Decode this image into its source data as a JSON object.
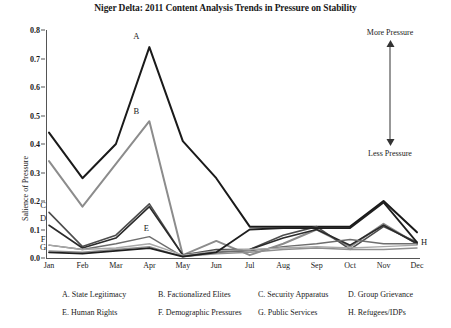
{
  "title": "Niger Delta: 2011 Content Analysis Trends in Pressure on Stability",
  "annotation": {
    "top_label": "More Pressure",
    "bottom_label": "Less Pressure",
    "arrow_icon": "double-headed-vertical-arrow-icon"
  },
  "legend": {
    "row1": [
      {
        "key": "A",
        "label": "A. State Legitimacy"
      },
      {
        "key": "B",
        "label": "B. Factionalized Elites"
      },
      {
        "key": "C",
        "label": "C. Security Apparatus"
      },
      {
        "key": "D",
        "label": "D. Group Grievance"
      }
    ],
    "row2": [
      {
        "key": "E",
        "label": "E. Human Rights"
      },
      {
        "key": "F",
        "label": "F. Demographic Pressures"
      },
      {
        "key": "G",
        "label": "G. Public Services"
      },
      {
        "key": "H",
        "label": "H. Refugees/IDPs"
      }
    ]
  },
  "inline_labels": [
    {
      "key": "A",
      "label": "A"
    },
    {
      "key": "B",
      "label": "B"
    },
    {
      "key": "C",
      "label": "C"
    },
    {
      "key": "D",
      "label": "D"
    },
    {
      "key": "E",
      "label": "E"
    },
    {
      "key": "F",
      "label": "F"
    },
    {
      "key": "G",
      "label": "G"
    },
    {
      "key": "H",
      "label": "H"
    }
  ],
  "chart_data": {
    "type": "line",
    "title": "Niger Delta: 2011 Content Analysis Trends in Pressure on Stability",
    "xlabel": "",
    "ylabel": "Salience of Pressure",
    "categories": [
      "Jan",
      "Feb",
      "Mar",
      "Apr",
      "May",
      "Jun",
      "Jul",
      "Aug",
      "Sep",
      "Oct",
      "Nov",
      "Dec"
    ],
    "ylim": [
      0.0,
      0.8
    ],
    "yticks": [
      "0.0",
      "0.1",
      "0.2",
      "0.3",
      "0.4",
      "0.5",
      "0.6",
      "0.7",
      "0.8"
    ],
    "grid": false,
    "legend_position": "below-plot",
    "series": [
      {
        "name": "A. State Legitimacy",
        "key": "A",
        "color": "#1a1a1a",
        "width": 2.0,
        "values": [
          0.44,
          0.28,
          0.4,
          0.74,
          0.41,
          0.28,
          0.11,
          0.11,
          0.11,
          0.11,
          0.2,
          0.09
        ]
      },
      {
        "name": "B. Factionalized Elites",
        "key": "B",
        "color": "#8c8c8c",
        "width": 2.0,
        "values": [
          0.34,
          0.18,
          0.33,
          0.48,
          0.01,
          0.06,
          0.01,
          0.05,
          0.1,
          0.04,
          0.12,
          0.05
        ]
      },
      {
        "name": "C. Security Apparatus",
        "key": "C",
        "color": "#4d4d4d",
        "width": 1.6,
        "values": [
          0.16,
          0.04,
          0.08,
          0.19,
          0.01,
          0.03,
          0.03,
          0.08,
          0.11,
          0.03,
          0.11,
          0.055
        ]
      },
      {
        "name": "D. Group Grievance",
        "key": "D",
        "color": "#2b2b2b",
        "width": 1.6,
        "values": [
          0.115,
          0.035,
          0.07,
          0.18,
          0.01,
          0.02,
          0.03,
          0.07,
          0.1,
          0.045,
          0.115,
          0.05
        ]
      },
      {
        "name": "E. Human Rights",
        "key": "E",
        "color": "#6e6e6e",
        "width": 1.4,
        "values": [
          0.045,
          0.03,
          0.05,
          0.075,
          0.005,
          0.02,
          0.025,
          0.04,
          0.05,
          0.065,
          0.05,
          0.05
        ]
      },
      {
        "name": "F. Demographic Pressures",
        "key": "F",
        "color": "#a8a8a8",
        "width": 1.4,
        "values": [
          0.045,
          0.03,
          0.035,
          0.05,
          0.01,
          0.025,
          0.03,
          0.035,
          0.04,
          0.035,
          0.04,
          0.045
        ]
      },
      {
        "name": "G. Public Services",
        "key": "G",
        "color": "#8f8f8f",
        "width": 1.4,
        "values": [
          0.025,
          0.02,
          0.03,
          0.04,
          0.005,
          0.015,
          0.02,
          0.03,
          0.035,
          0.03,
          0.03,
          0.035
        ]
      },
      {
        "name": "H. Refugees/IDPs",
        "key": "H",
        "color": "#1f1f1f",
        "width": 1.8,
        "values": [
          0.02,
          0.015,
          0.025,
          0.035,
          0.005,
          0.02,
          0.1,
          0.105,
          0.105,
          0.105,
          0.195,
          0.055
        ]
      }
    ]
  }
}
